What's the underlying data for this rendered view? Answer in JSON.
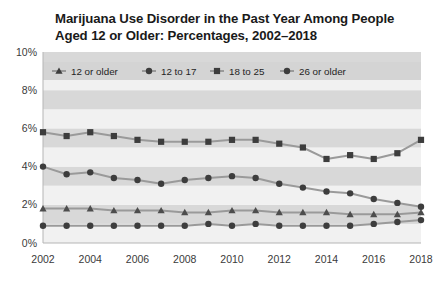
{
  "chart_data": {
    "type": "line",
    "title": "Marijuana Use Disorder in the Past Year Among People Aged 12 or Older: Percentages, 2002–2018",
    "title_line1": "Marijuana Use Disorder in the Past Year Among People",
    "title_line2": "Aged 12 or Older: Percentages, 2002–2018",
    "xlabel": "",
    "ylabel": "",
    "x": [
      2002,
      2003,
      2004,
      2005,
      2006,
      2007,
      2008,
      2009,
      2010,
      2011,
      2012,
      2013,
      2014,
      2015,
      2016,
      2017,
      2018
    ],
    "xtick_labels": [
      "2002",
      "2004",
      "2006",
      "2008",
      "2010",
      "2012",
      "2014",
      "2016",
      "2018"
    ],
    "xticks": [
      2002,
      2004,
      2006,
      2008,
      2010,
      2012,
      2014,
      2016,
      2018
    ],
    "ytick_labels": [
      "0%",
      "2%",
      "4%",
      "6%",
      "8%",
      "10%"
    ],
    "yticks": [
      0,
      2,
      4,
      6,
      8,
      10
    ],
    "ylim": [
      0,
      10
    ],
    "xlim": [
      2002,
      2018
    ],
    "grid": "horizontal-bands",
    "legend_position": "top-inside",
    "series": [
      {
        "name": "12 or older",
        "marker": "triangle",
        "color": "#4d4d4d",
        "line_color": "#9a9a9a",
        "values": [
          1.8,
          1.8,
          1.8,
          1.7,
          1.7,
          1.7,
          1.6,
          1.6,
          1.7,
          1.7,
          1.6,
          1.6,
          1.6,
          1.5,
          1.5,
          1.5,
          1.6
        ]
      },
      {
        "name": "12 to 17",
        "marker": "circle",
        "color": "#3d3d3d",
        "line_color": "#9a9a9a",
        "values": [
          4.0,
          3.6,
          3.7,
          3.4,
          3.3,
          3.1,
          3.3,
          3.4,
          3.5,
          3.4,
          3.1,
          2.9,
          2.7,
          2.6,
          2.3,
          2.1,
          1.9
        ]
      },
      {
        "name": "18 to 25",
        "marker": "square",
        "color": "#3d3d3d",
        "line_color": "#9a9a9a",
        "values": [
          5.8,
          5.6,
          5.8,
          5.6,
          5.4,
          5.3,
          5.3,
          5.3,
          5.4,
          5.4,
          5.2,
          5.0,
          4.4,
          4.6,
          4.4,
          4.7,
          5.4
        ]
      },
      {
        "name": "26 or older",
        "marker": "circle",
        "color": "#3d3d3d",
        "line_color": "#9a9a9a",
        "values": [
          0.9,
          0.9,
          0.9,
          0.9,
          0.9,
          0.9,
          0.9,
          1.0,
          0.9,
          1.0,
          0.9,
          0.9,
          0.9,
          0.9,
          1.0,
          1.1,
          1.2
        ]
      }
    ]
  },
  "legend": {
    "items": [
      {
        "label": "12 or older",
        "marker": "triangle"
      },
      {
        "label": "12 to 17",
        "marker": "circle"
      },
      {
        "label": "18 to 25",
        "marker": "square"
      },
      {
        "label": "26 or older",
        "marker": "circle"
      }
    ]
  },
  "colors": {
    "band_light": "#f1f1f1",
    "band_dark": "#d8d8d8",
    "legend_band": "#d4d4d4",
    "line": "#9a9a9a",
    "marker": "#3d3d3d",
    "axis": "#b5b5b5",
    "text": "#333333",
    "title": "#1a1a1a",
    "background": "#ffffff"
  }
}
